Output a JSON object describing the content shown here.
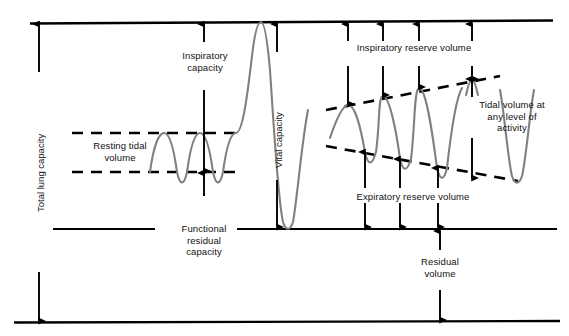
{
  "diagram": {
    "type": "physiology-spirogram",
    "colors": {
      "trace": "#808080",
      "ink": "#000000",
      "background": "#ffffff",
      "text": "#111111"
    },
    "labels": {
      "total_lung_capacity": "Total lung capacity",
      "inspiratory_capacity": "Inspiratory\ncapacity",
      "resting_tidal_volume": "Resting tidal\nvolume",
      "vital_capacity": "Vital capacity",
      "functional_residual_capacity": "Functional\nresidual\ncapacity",
      "inspiratory_reserve_volume": "Inspiratory reserve volume",
      "expiratory_reserve_volume": "Expiratory reserve volume",
      "tidal_volume_any_level": "Tidal volume at\nany level of\nactivity",
      "residual_volume": "Residual\nvolume"
    },
    "levels": {
      "total_lung_capacity_line_y": 22,
      "tidal_peak_dashed_y": 133,
      "tidal_trough_dashed_y": 172,
      "functional_residual_capacity_line_y": 229,
      "residual_baseline_y": 322
    },
    "measure_arrows": [
      {
        "name": "total-lung-capacity",
        "x": 39,
        "from_y": 22,
        "to_y": 322,
        "heads": "both"
      },
      {
        "name": "inspiratory-capacity",
        "x": 204,
        "from_y": 22,
        "to_y": 172,
        "heads": "both"
      },
      {
        "name": "vital-capacity",
        "x": 277,
        "from_y": 22,
        "to_y": 229,
        "heads": "both"
      },
      {
        "name": "inspiratory-reserve-volume-1",
        "x": 348,
        "from_y": 22,
        "to_y": 105,
        "heads": "both"
      },
      {
        "name": "inspiratory-reserve-volume-2",
        "x": 383,
        "from_y": 22,
        "to_y": 96,
        "heads": "both"
      },
      {
        "name": "inspiratory-reserve-volume-3",
        "x": 419,
        "from_y": 22,
        "to_y": 88,
        "heads": "both"
      },
      {
        "name": "inspiratory-reserve-volume-4",
        "x": 472,
        "from_y": 22,
        "to_y": 80,
        "heads": "both"
      },
      {
        "name": "expiratory-reserve-volume-1",
        "x": 365,
        "from_y": 153,
        "to_y": 229,
        "heads": "both"
      },
      {
        "name": "expiratory-reserve-volume-2",
        "x": 400,
        "from_y": 160,
        "to_y": 229,
        "heads": "both"
      },
      {
        "name": "expiratory-reserve-volume-3",
        "x": 438,
        "from_y": 170,
        "to_y": 229,
        "heads": "both"
      },
      {
        "name": "tidal-volume-any-level",
        "x": 472,
        "from_y": 80,
        "to_y": 176,
        "heads": "both"
      },
      {
        "name": "residual-volume",
        "x": 440,
        "from_y": 229,
        "to_y": 322,
        "heads": "both"
      }
    ],
    "trace_description": {
      "left_segment": "three resting tidal breaths followed by a maximal inspiration and maximal expiration",
      "right_segment": "three progressively deeper breaths then a small tidal breath at an elevated level"
    }
  }
}
